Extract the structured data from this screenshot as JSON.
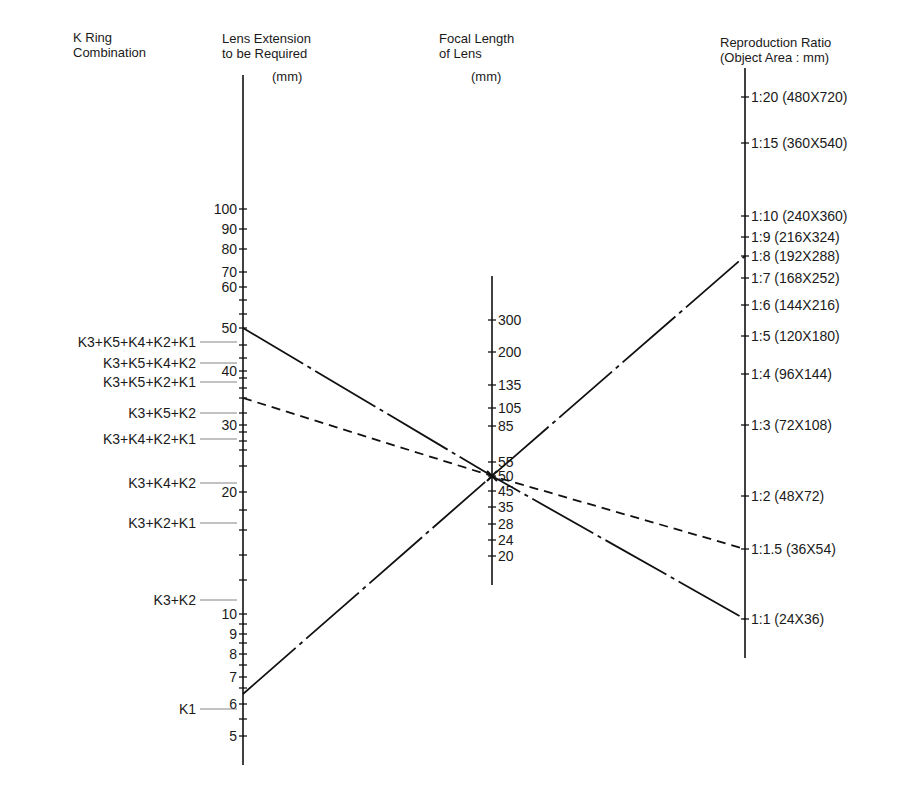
{
  "headers": {
    "k_ring": {
      "line1": "K Ring",
      "line2": "Combination"
    },
    "extension": {
      "line1": "Lens Extension",
      "line2": "to be Required",
      "unit": "(mm)"
    },
    "focal": {
      "line1": "Focal Length",
      "line2": "of Lens",
      "unit": "(mm)"
    },
    "ratio": {
      "line1": "Reproduction Ratio",
      "line2": "(Object Area : mm)"
    }
  },
  "axes": {
    "extension": {
      "x": 243,
      "y_top": 75,
      "y_bottom": 765,
      "ticks": [
        {
          "label": "100",
          "y": 209
        },
        {
          "label": "90",
          "y": 229
        },
        {
          "label": "80",
          "y": 249
        },
        {
          "label": "70",
          "y": 272
        },
        {
          "label": "60",
          "y": 287
        },
        {
          "label": "",
          "y": 300
        },
        {
          "label": "",
          "y": 314
        },
        {
          "label": "50",
          "y": 328
        },
        {
          "label": "",
          "y": 345
        },
        {
          "label": "",
          "y": 358
        },
        {
          "label": "40",
          "y": 371
        },
        {
          "label": "",
          "y": 378
        },
        {
          "label": "",
          "y": 388
        },
        {
          "label": "",
          "y": 398
        },
        {
          "label": "",
          "y": 413
        },
        {
          "label": "30",
          "y": 425
        },
        {
          "label": "",
          "y": 432
        },
        {
          "label": "",
          "y": 441
        },
        {
          "label": "",
          "y": 450
        },
        {
          "label": "",
          "y": 466
        },
        {
          "label": "20",
          "y": 492
        },
        {
          "label": "",
          "y": 510
        },
        {
          "label": "",
          "y": 530
        },
        {
          "label": "",
          "y": 555
        },
        {
          "label": "",
          "y": 580
        },
        {
          "label": "10",
          "y": 614
        },
        {
          "label": "",
          "y": 624
        },
        {
          "label": "9",
          "y": 634
        },
        {
          "label": "",
          "y": 643
        },
        {
          "label": "8",
          "y": 654
        },
        {
          "label": "",
          "y": 665
        },
        {
          "label": "7",
          "y": 677
        },
        {
          "label": "",
          "y": 688
        },
        {
          "label": "6",
          "y": 704
        },
        {
          "label": "",
          "y": 719
        },
        {
          "label": "5",
          "y": 736
        }
      ]
    },
    "focal": {
      "x": 492,
      "y_top": 276,
      "y_bottom": 585,
      "ticks": [
        {
          "label": "300",
          "y": 320
        },
        {
          "label": "200",
          "y": 352
        },
        {
          "label": "135",
          "y": 385
        },
        {
          "label": "105",
          "y": 408
        },
        {
          "label": "85",
          "y": 426
        },
        {
          "label": "55",
          "y": 462
        },
        {
          "label": "50",
          "y": 476
        },
        {
          "label": "45",
          "y": 491
        },
        {
          "label": "35",
          "y": 507
        },
        {
          "label": "28",
          "y": 524
        },
        {
          "label": "24",
          "y": 540
        },
        {
          "label": "20",
          "y": 556
        }
      ]
    },
    "ratio": {
      "x": 745,
      "y_top": 68,
      "y_bottom": 658,
      "ticks": [
        {
          "label": "1:20 (480X720)",
          "y": 97
        },
        {
          "label": "1:15 (360X540)",
          "y": 143
        },
        {
          "label": "1:10 (240X360)",
          "y": 216
        },
        {
          "label": "1:9 (216X324)",
          "y": 237
        },
        {
          "label": "1:8 (192X288)",
          "y": 256
        },
        {
          "label": "1:7 (168X252)",
          "y": 278
        },
        {
          "label": "1:6 (144X216)",
          "y": 305
        },
        {
          "label": "1:5 (120X180)",
          "y": 336
        },
        {
          "label": "1:4 (96X144)",
          "y": 374
        },
        {
          "label": "1:3 (72X108)",
          "y": 425
        },
        {
          "label": "1:2 (48X72)",
          "y": 496
        },
        {
          "label": "1:1.5 (36X54)",
          "y": 549
        },
        {
          "label": "1:1 (24X36)",
          "y": 619
        }
      ]
    }
  },
  "k_rings": [
    {
      "label": "K3+K5+K4+K2+K1",
      "y": 342
    },
    {
      "label": "K3+K5+K4+K2",
      "y": 363
    },
    {
      "label": "K3+K5+K2+K1",
      "y": 382
    },
    {
      "label": "K3+K5+K2",
      "y": 413
    },
    {
      "label": "K3+K4+K2+K1",
      "y": 439
    },
    {
      "label": "K3+K4+K2",
      "y": 483
    },
    {
      "label": "K3+K2+K1",
      "y": 523
    },
    {
      "label": "K3+K2",
      "y": 600
    },
    {
      "label": "K1",
      "y": 709
    }
  ],
  "example_lines": [
    {
      "name": "solid-line-50mm-extension-to-1-1",
      "style": "dashdot",
      "points": [
        [
          243,
          328
        ],
        [
          492,
          476
        ],
        [
          745,
          619
        ]
      ]
    },
    {
      "name": "dashed-line-34mm-extension-to-1-1.5",
      "style": "dashed",
      "points": [
        [
          243,
          398
        ],
        [
          492,
          476
        ],
        [
          745,
          549
        ]
      ]
    },
    {
      "name": "dashdot-line-6mm-extension-to-1-8",
      "style": "dashdot",
      "points": [
        [
          243,
          694
        ],
        [
          492,
          476
        ],
        [
          745,
          256
        ]
      ]
    }
  ],
  "chart_data": {
    "type": "nomogram",
    "scales": [
      {
        "name": "K Ring Combination",
        "values": [
          "K3+K5+K4+K2+K1",
          "K3+K5+K4+K2",
          "K3+K5+K2+K1",
          "K3+K5+K2",
          "K3+K4+K2+K1",
          "K3+K4+K2",
          "K3+K2+K1",
          "K3+K2",
          "K1"
        ]
      },
      {
        "name": "Lens Extension to be Required (mm)",
        "labeled_ticks": [
          100,
          90,
          80,
          70,
          60,
          50,
          40,
          30,
          20,
          10,
          9,
          8,
          7,
          6,
          5
        ],
        "scale": "log"
      },
      {
        "name": "Focal Length of Lens (mm)",
        "labeled_ticks": [
          300,
          200,
          135,
          105,
          85,
          55,
          50,
          45,
          35,
          28,
          24,
          20
        ]
      },
      {
        "name": "Reproduction Ratio (Object Area : mm)",
        "labeled_ticks": [
          "1:20 (480X720)",
          "1:15 (360X540)",
          "1:10 (240X360)",
          "1:9 (216X324)",
          "1:8 (192X288)",
          "1:7 (168X252)",
          "1:6 (144X216)",
          "1:5 (120X180)",
          "1:4 (96X144)",
          "1:3 (72X108)",
          "1:2 (48X72)",
          "1:1.5 (36X54)",
          "1:1 (24X36)"
        ]
      }
    ],
    "examples": [
      {
        "extension_mm": 50,
        "focal_mm": 50,
        "ratio": "1:1"
      },
      {
        "extension_mm": 34,
        "focal_mm": 50,
        "ratio": "1:1.5"
      },
      {
        "extension_mm": 6.3,
        "focal_mm": 50,
        "ratio": "1:8"
      }
    ]
  }
}
